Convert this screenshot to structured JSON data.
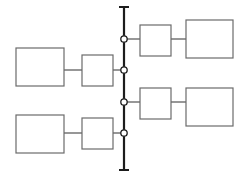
{
  "diagram": {
    "type": "block-diagram",
    "canvas": {
      "width": 245,
      "height": 177,
      "background": "#ffffff"
    },
    "colors": {
      "box_stroke": "#6b6b6b",
      "box_fill": "#ffffff",
      "link_stroke": "#6b6b6b",
      "bus_stroke": "#1c1c1c",
      "node_fill": "#ffffff",
      "node_stroke": "#1c1c1c"
    },
    "bus": {
      "label": "",
      "x": 124,
      "y_top": 7,
      "y_bottom": 170,
      "cap_half_width": 5,
      "node_radius": 3.2,
      "node_count": 4,
      "nodes": [
        {
          "id": "bus-node-1",
          "label": "",
          "x": 124,
          "y": 39,
          "side": "right"
        },
        {
          "id": "bus-node-2",
          "label": "",
          "x": 124,
          "y": 70,
          "side": "left"
        },
        {
          "id": "bus-node-3",
          "label": "",
          "x": 124,
          "y": 102,
          "side": "right"
        },
        {
          "id": "bus-node-4",
          "label": "",
          "x": 124,
          "y": 133,
          "side": "left"
        }
      ]
    },
    "boxes": [
      {
        "id": "box-left-upper-outer",
        "label": "",
        "x": 16,
        "y": 48,
        "width": 48,
        "height": 38
      },
      {
        "id": "box-left-upper-inner",
        "label": "",
        "x": 82,
        "y": 55,
        "width": 31,
        "height": 31
      },
      {
        "id": "box-left-lower-outer",
        "label": "",
        "x": 16,
        "y": 115,
        "width": 48,
        "height": 38
      },
      {
        "id": "box-left-lower-inner",
        "label": "",
        "x": 82,
        "y": 118,
        "width": 31,
        "height": 31
      },
      {
        "id": "box-right-upper-inner",
        "label": "",
        "x": 140,
        "y": 25,
        "width": 31,
        "height": 31
      },
      {
        "id": "box-right-upper-outer",
        "label": "",
        "x": 186,
        "y": 20,
        "width": 47,
        "height": 38
      },
      {
        "id": "box-right-lower-inner",
        "label": "",
        "x": 140,
        "y": 88,
        "width": 31,
        "height": 31
      },
      {
        "id": "box-right-lower-outer",
        "label": "",
        "x": 186,
        "y": 88,
        "width": 47,
        "height": 38
      }
    ],
    "links": [
      {
        "id": "link-left-upper-outer-inner",
        "label": "",
        "x1": 64,
        "y1": 70,
        "x2": 82,
        "y2": 70
      },
      {
        "id": "link-left-upper-inner-bus",
        "label": "",
        "x1": 113,
        "y1": 70,
        "x2": 124,
        "y2": 70
      },
      {
        "id": "link-left-lower-outer-inner",
        "label": "",
        "x1": 64,
        "y1": 133,
        "x2": 82,
        "y2": 133
      },
      {
        "id": "link-left-lower-inner-bus",
        "label": "",
        "x1": 113,
        "y1": 133,
        "x2": 124,
        "y2": 133
      },
      {
        "id": "link-bus-right-upper-inner",
        "label": "",
        "x1": 124,
        "y1": 39,
        "x2": 140,
        "y2": 39
      },
      {
        "id": "link-right-upper-inner-outer",
        "label": "",
        "x1": 171,
        "y1": 39,
        "x2": 186,
        "y2": 39
      },
      {
        "id": "link-bus-right-lower-inner",
        "label": "",
        "x1": 124,
        "y1": 102,
        "x2": 140,
        "y2": 102
      },
      {
        "id": "link-right-lower-inner-outer",
        "label": "",
        "x1": 171,
        "y1": 102,
        "x2": 186,
        "y2": 102
      }
    ]
  }
}
